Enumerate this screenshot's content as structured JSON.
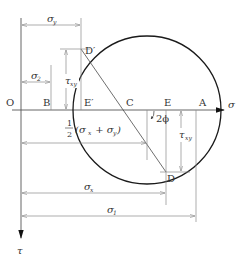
{
  "diagram": {
    "axes": {
      "horizontal_label": "σ",
      "vertical_label": "τ",
      "origin_label": "O"
    },
    "points": {
      "B": "B",
      "E_prime": "E′",
      "C": "C",
      "E": "E",
      "A": "A",
      "D_prime": "D′",
      "D": "D"
    },
    "angle_label": "2ϕ",
    "dimensions": {
      "sigma_y": {
        "main": "σ",
        "sub": "y"
      },
      "sigma_2": {
        "main": "σ",
        "sub": "2"
      },
      "tau_xy_left": {
        "main": "τ",
        "sub": "xy"
      },
      "tau_xy_right": {
        "main": "τ",
        "sub": "xy"
      },
      "half_sum": {
        "frac_num": "1",
        "frac_den": "2",
        "expr_open": "(σ",
        "sub_x": "x",
        "plus": " + σ",
        "sub_y": "y",
        "expr_close": ")"
      },
      "sigma_x": {
        "main": "σ",
        "sub": "x"
      },
      "sigma_1": {
        "main": "σ",
        "sub": "1"
      }
    },
    "colors": {
      "circle": "#1a1a1a",
      "lines": "#8a8a8a",
      "text": "#333333"
    }
  }
}
